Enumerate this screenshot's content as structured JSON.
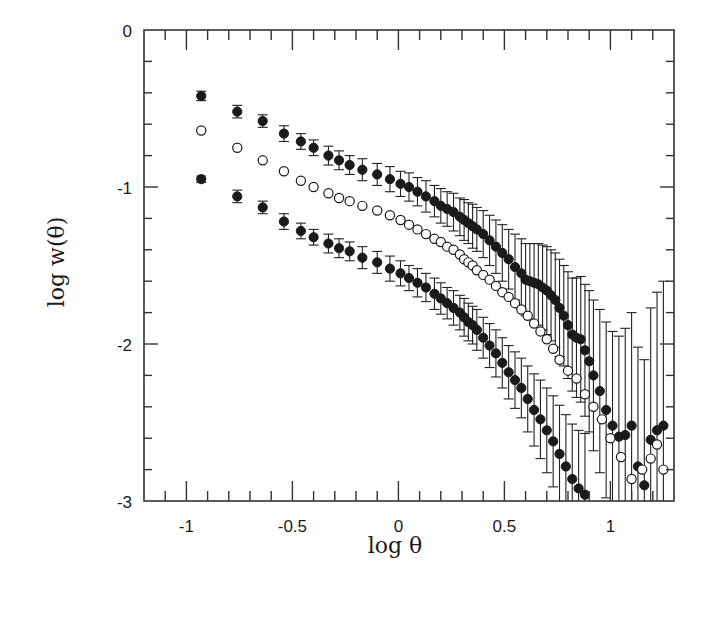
{
  "chart_data": {
    "type": "scatter",
    "title": "",
    "xlabel": "log θ",
    "ylabel": "log w(θ)",
    "xlim": [
      -1.2,
      1.3
    ],
    "ylim": [
      -3,
      0
    ],
    "x_ticks": [
      -1,
      -0.5,
      0,
      0.5,
      1
    ],
    "x_tick_labels": [
      "-1",
      "-0.5",
      "0",
      "0.5",
      "1"
    ],
    "y_ticks": [
      0,
      -1,
      -2,
      -3
    ],
    "y_tick_labels": [
      "0",
      "-1",
      "-2",
      "-3"
    ],
    "grid": false,
    "legend": null,
    "series": [
      {
        "name": "upper (filled, with error bars)",
        "marker": "filled-circle",
        "x": [
          -0.93,
          -0.76,
          -0.64,
          -0.54,
          -0.46,
          -0.4,
          -0.33,
          -0.28,
          -0.23,
          -0.17,
          -0.1,
          -0.04,
          0.01,
          0.05,
          0.09,
          0.13,
          0.17,
          0.2,
          0.23,
          0.26,
          0.29,
          0.31,
          0.33,
          0.35,
          0.37,
          0.4,
          0.43,
          0.46,
          0.49,
          0.52,
          0.55,
          0.58,
          0.6,
          0.62,
          0.64,
          0.66,
          0.68,
          0.7,
          0.72,
          0.74,
          0.76,
          0.78,
          0.8,
          0.82,
          0.84,
          0.86,
          0.88,
          0.9,
          0.92,
          0.95,
          0.98,
          1.01,
          1.04,
          1.07,
          1.1,
          1.13,
          1.16,
          1.19,
          1.22,
          1.25
        ],
        "y": [
          -0.42,
          -0.52,
          -0.58,
          -0.66,
          -0.71,
          -0.75,
          -0.8,
          -0.83,
          -0.86,
          -0.89,
          -0.92,
          -0.95,
          -0.98,
          -1.0,
          -1.03,
          -1.06,
          -1.09,
          -1.12,
          -1.14,
          -1.16,
          -1.19,
          -1.21,
          -1.23,
          -1.25,
          -1.27,
          -1.3,
          -1.34,
          -1.38,
          -1.42,
          -1.46,
          -1.51,
          -1.55,
          -1.59,
          -1.6,
          -1.61,
          -1.62,
          -1.64,
          -1.66,
          -1.69,
          -1.72,
          -1.77,
          -1.82,
          -1.88,
          -1.94,
          -1.96,
          -1.97,
          -2.04,
          -2.11,
          -2.2,
          -2.3,
          -2.42,
          -2.52,
          -2.59,
          -2.58,
          -2.52,
          -2.78,
          -2.9,
          -2.61,
          -2.55,
          -2.52
        ],
        "yerr": [
          0.03,
          0.04,
          0.04,
          0.05,
          0.05,
          0.05,
          0.06,
          0.06,
          0.06,
          0.07,
          0.07,
          0.08,
          0.08,
          0.09,
          0.09,
          0.1,
          0.1,
          0.11,
          0.11,
          0.12,
          0.12,
          0.13,
          0.13,
          0.14,
          0.14,
          0.15,
          0.16,
          0.17,
          0.18,
          0.19,
          0.21,
          0.22,
          0.23,
          0.24,
          0.25,
          0.26,
          0.27,
          0.28,
          0.29,
          0.3,
          0.31,
          0.32,
          0.34,
          0.36,
          0.38,
          0.4,
          0.42,
          0.45,
          0.48,
          0.52,
          0.56,
          0.6,
          0.64,
          0.68,
          0.72,
          0.76,
          0.8,
          0.84,
          0.88,
          0.92
        ]
      },
      {
        "name": "middle (open circles)",
        "marker": "open-circle",
        "x": [
          -0.93,
          -0.76,
          -0.64,
          -0.54,
          -0.46,
          -0.4,
          -0.33,
          -0.28,
          -0.23,
          -0.17,
          -0.1,
          -0.04,
          0.01,
          0.05,
          0.09,
          0.13,
          0.17,
          0.2,
          0.23,
          0.26,
          0.29,
          0.31,
          0.33,
          0.35,
          0.37,
          0.4,
          0.43,
          0.46,
          0.49,
          0.52,
          0.55,
          0.58,
          0.61,
          0.64,
          0.67,
          0.7,
          0.73,
          0.76,
          0.8,
          0.84,
          0.88,
          0.92,
          0.96,
          1.0,
          1.05,
          1.1,
          1.15,
          1.19,
          1.22,
          1.25
        ],
        "y": [
          -0.64,
          -0.75,
          -0.83,
          -0.9,
          -0.96,
          -1.0,
          -1.04,
          -1.07,
          -1.09,
          -1.12,
          -1.15,
          -1.18,
          -1.21,
          -1.24,
          -1.27,
          -1.3,
          -1.33,
          -1.35,
          -1.38,
          -1.4,
          -1.43,
          -1.46,
          -1.48,
          -1.5,
          -1.53,
          -1.56,
          -1.59,
          -1.63,
          -1.67,
          -1.7,
          -1.74,
          -1.78,
          -1.82,
          -1.87,
          -1.92,
          -1.97,
          -2.03,
          -2.1,
          -2.17,
          -2.22,
          -2.32,
          -2.4,
          -2.48,
          -2.6,
          -2.72,
          -2.86,
          -2.8,
          -2.73,
          -2.64,
          -2.8
        ]
      },
      {
        "name": "lower (filled, with error bars)",
        "marker": "filled-circle",
        "x": [
          -0.93,
          -0.76,
          -0.64,
          -0.54,
          -0.46,
          -0.4,
          -0.33,
          -0.28,
          -0.23,
          -0.17,
          -0.1,
          -0.04,
          0.01,
          0.05,
          0.09,
          0.13,
          0.17,
          0.2,
          0.23,
          0.26,
          0.29,
          0.31,
          0.33,
          0.35,
          0.37,
          0.4,
          0.43,
          0.46,
          0.49,
          0.52,
          0.55,
          0.58,
          0.61,
          0.64,
          0.67,
          0.7,
          0.73,
          0.76,
          0.79,
          0.82,
          0.85,
          0.88
        ],
        "y": [
          -0.95,
          -1.06,
          -1.13,
          -1.22,
          -1.28,
          -1.32,
          -1.36,
          -1.39,
          -1.41,
          -1.45,
          -1.48,
          -1.52,
          -1.55,
          -1.58,
          -1.61,
          -1.64,
          -1.68,
          -1.71,
          -1.74,
          -1.77,
          -1.8,
          -1.83,
          -1.86,
          -1.88,
          -1.91,
          -1.96,
          -2.01,
          -2.06,
          -2.12,
          -2.18,
          -2.23,
          -2.28,
          -2.35,
          -2.42,
          -2.48,
          -2.55,
          -2.62,
          -2.7,
          -2.78,
          -2.86,
          -2.92,
          -2.96
        ],
        "yerr": [
          0.02,
          0.04,
          0.04,
          0.05,
          0.05,
          0.05,
          0.06,
          0.06,
          0.06,
          0.07,
          0.07,
          0.08,
          0.08,
          0.08,
          0.09,
          0.09,
          0.1,
          0.1,
          0.1,
          0.11,
          0.11,
          0.12,
          0.12,
          0.12,
          0.13,
          0.13,
          0.14,
          0.15,
          0.16,
          0.17,
          0.18,
          0.19,
          0.21,
          0.23,
          0.25,
          0.27,
          0.29,
          0.31,
          0.33,
          0.35,
          0.37,
          0.39
        ]
      }
    ]
  }
}
